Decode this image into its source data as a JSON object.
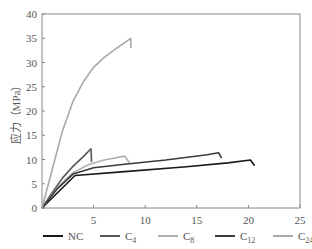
{
  "chart_data": {
    "type": "line",
    "title": "",
    "xlabel": "",
    "ylabel": "应力（MPa）",
    "xlim": [
      0,
      25
    ],
    "ylim": [
      0,
      40
    ],
    "xticks": [
      5,
      10,
      15,
      20,
      25
    ],
    "yticks": [
      0,
      5,
      10,
      15,
      20,
      25,
      30,
      35,
      40
    ],
    "grid": false,
    "legend_position": "bottom",
    "series": [
      {
        "name": "NC",
        "label_main": "NC",
        "label_sub": "",
        "color": "#1a1a1a",
        "x": [
          0,
          3.2,
          8,
          14,
          18,
          20.2,
          20.6
        ],
        "y": [
          0,
          6.7,
          7.5,
          8.5,
          9.3,
          9.9,
          8.7
        ]
      },
      {
        "name": "C4",
        "label_main": "C",
        "label_sub": "4",
        "color": "#555555",
        "x": [
          0,
          1,
          2,
          3,
          4,
          4.75,
          4.8
        ],
        "y": [
          0,
          3.2,
          6.2,
          8.6,
          10.6,
          12.2,
          9.5
        ]
      },
      {
        "name": "C8",
        "label_main": "C",
        "label_sub": "8",
        "color": "#b0b0b0",
        "x": [
          0,
          1.5,
          3,
          4.5,
          6,
          7.5,
          8.0,
          8.5
        ],
        "y": [
          0,
          4.2,
          7.3,
          8.9,
          9.9,
          10.5,
          10.7,
          9.3
        ]
      },
      {
        "name": "C12",
        "label_main": "C",
        "label_sub": "12",
        "color": "#3a3a3a",
        "x": [
          0,
          1.5,
          3,
          5,
          8,
          12,
          16,
          17.1,
          17.4
        ],
        "y": [
          0,
          4.0,
          7.0,
          8.3,
          9.0,
          9.9,
          11.0,
          11.4,
          10.3
        ]
      },
      {
        "name": "C24",
        "label_main": "C",
        "label_sub": "24",
        "color": "#a8a8a8",
        "x": [
          0,
          1,
          2,
          3,
          4,
          5,
          6,
          7,
          8.6,
          8.6
        ],
        "y": [
          0,
          8,
          16,
          22,
          26,
          29,
          31,
          32.6,
          35,
          33
        ]
      }
    ]
  }
}
